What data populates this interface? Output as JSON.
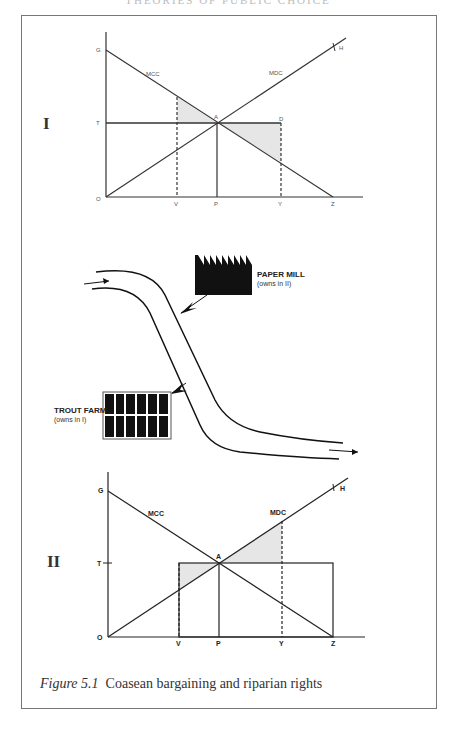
{
  "page_header": "THEORIES OF PUBLIC CHOICE",
  "caption": {
    "figure_label": "Figure 5.1",
    "text": "Coasean bargaining and riparian rights"
  },
  "panel_I": {
    "roman": "I",
    "labels": {
      "G": "G",
      "T": "T",
      "O": "O",
      "V": "V",
      "P": "P",
      "Y": "Y",
      "Z": "Z",
      "A": "A",
      "D": "D",
      "H": "H",
      "MCC": "MCC",
      "MDC": "MDC"
    }
  },
  "illustration": {
    "paper_mill": {
      "name": "PAPER MILL",
      "note": "(owns in II)"
    },
    "trout_farm": {
      "name": "TROUT FARM",
      "note": "(owns in I)"
    }
  },
  "panel_II": {
    "roman": "II",
    "labels": {
      "G": "G",
      "T": "T",
      "O": "O",
      "V": "V",
      "P": "P",
      "Y": "Y",
      "Z": "Z",
      "A": "A",
      "H": "H",
      "MCC": "MCC",
      "MDC": "MDC"
    }
  },
  "colors": {
    "line": "#222222",
    "shade": "#e6e6e6",
    "frame": "#777777"
  }
}
